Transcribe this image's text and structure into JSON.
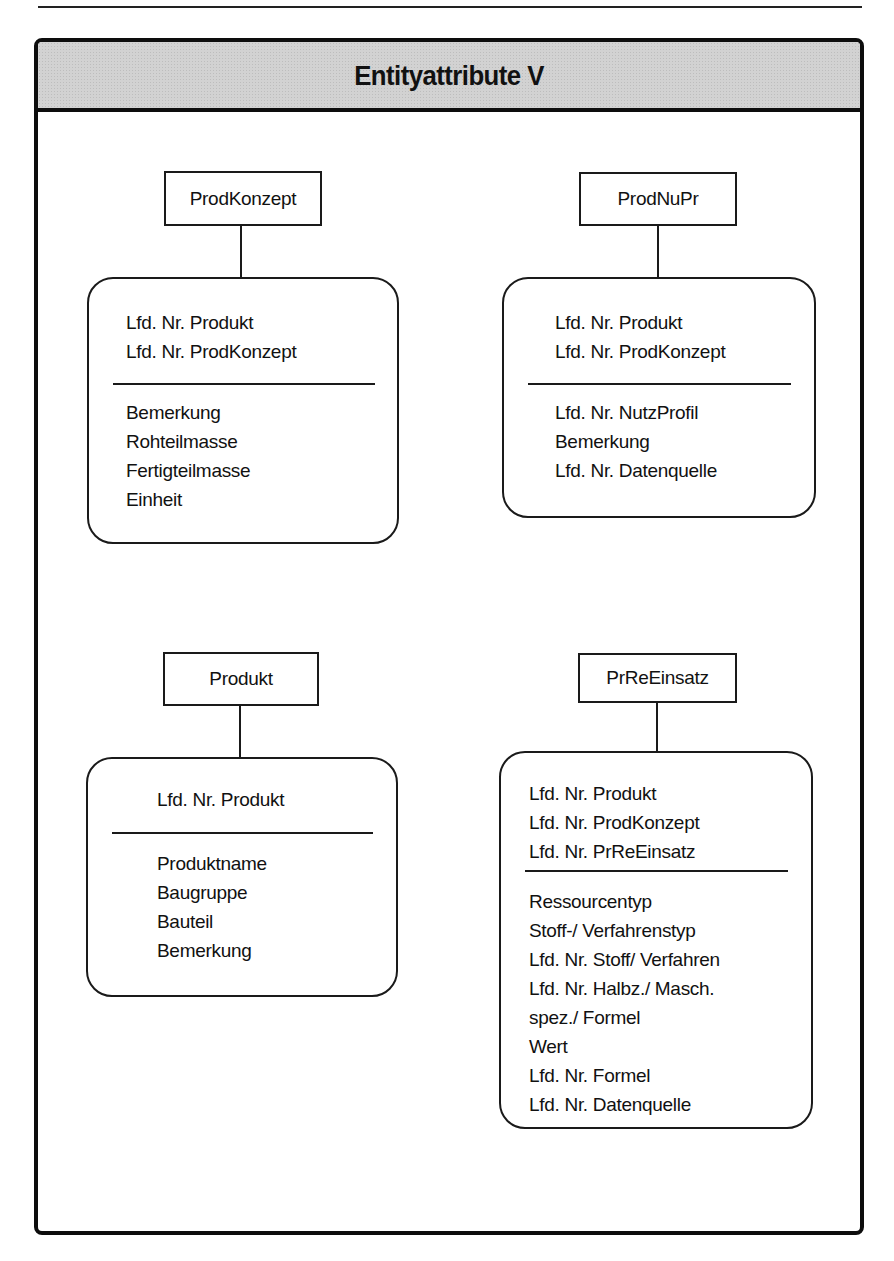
{
  "page": {
    "top_rule": true
  },
  "frame": {
    "title": "Entityattribute V",
    "header_color": "#d2d2d2",
    "border_color": "#0d0d0d"
  },
  "entities": [
    {
      "name": "ProdKonzept",
      "key_attributes": [
        "Lfd. Nr. Produkt",
        "Lfd. Nr. ProdKonzept"
      ],
      "attributes": [
        "Bemerkung",
        "Rohteilmasse",
        "Fertigteilmasse",
        "Einheit"
      ]
    },
    {
      "name": "ProdNuPr",
      "key_attributes": [
        "Lfd. Nr. Produkt",
        "Lfd. Nr. ProdKonzept"
      ],
      "attributes": [
        "Lfd. Nr. NutzProfil",
        "Bemerkung",
        "Lfd. Nr. Datenquelle"
      ]
    },
    {
      "name": "Produkt",
      "key_attributes": [
        "Lfd. Nr. Produkt"
      ],
      "attributes": [
        "Produktname",
        "Baugruppe",
        "Bauteil",
        "Bemerkung"
      ]
    },
    {
      "name": "PrReEinsatz",
      "key_attributes": [
        "Lfd. Nr. Produkt",
        "Lfd. Nr. ProdKonzept",
        "Lfd. Nr. PrReEinsatz"
      ],
      "attributes": [
        "Ressourcentyp",
        "Stoff-/ Verfahrenstyp",
        "Lfd. Nr. Stoff/ Verfahren",
        "Lfd. Nr. Halbz./ Masch.",
        "spez./ Formel",
        "Wert",
        "Lfd. Nr. Formel",
        "Lfd. Nr. Datenquelle"
      ]
    }
  ]
}
